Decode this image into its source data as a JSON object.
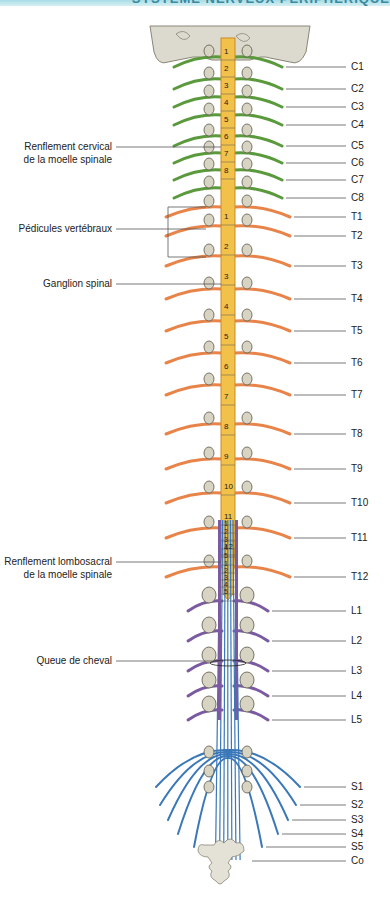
{
  "header": {
    "title": "SYSTÈME NERVEUX PÉRIPHÉRIQUE"
  },
  "colors": {
    "cervical": "#5a9a3c",
    "thoracic": "#e8844a",
    "lumbar": "#7a5aa0",
    "sacral": "#3a78b8",
    "cord": "#f2c14a",
    "bone": "#d8d4c4",
    "leader": "#555555"
  },
  "left_labels": [
    {
      "id": "cervical-enlargement",
      "line1": "Renflement cervical",
      "line2": "de la moelle spinale",
      "y": 147
    },
    {
      "id": "vertebral-pedicles",
      "line1": "Pédicules vertébraux",
      "line2": "",
      "y": 229
    },
    {
      "id": "spinal-ganglion",
      "line1": "Ganglion spinal",
      "line2": "",
      "y": 284
    },
    {
      "id": "lumbosacral-enlargement",
      "line1": "Renflement lombosacral",
      "line2": "de la moelle spinale",
      "y": 562
    },
    {
      "id": "cauda-equina",
      "line1": "Queue de cheval",
      "line2": "",
      "y": 661
    }
  ],
  "right_labels": [
    {
      "label": "C1",
      "y": 67
    },
    {
      "label": "C2",
      "y": 89
    },
    {
      "label": "C3",
      "y": 107
    },
    {
      "label": "C4",
      "y": 125
    },
    {
      "label": "C5",
      "y": 146
    },
    {
      "label": "C6",
      "y": 163
    },
    {
      "label": "C7",
      "y": 180
    },
    {
      "label": "C8",
      "y": 198
    },
    {
      "label": "T1",
      "y": 217
    },
    {
      "label": "T2",
      "y": 236
    },
    {
      "label": "T3",
      "y": 266
    },
    {
      "label": "T4",
      "y": 299
    },
    {
      "label": "T5",
      "y": 331
    },
    {
      "label": "T6",
      "y": 363
    },
    {
      "label": "T7",
      "y": 395
    },
    {
      "label": "T8",
      "y": 434
    },
    {
      "label": "T9",
      "y": 469
    },
    {
      "label": "T10",
      "y": 503
    },
    {
      "label": "T11",
      "y": 538
    },
    {
      "label": "T12",
      "y": 577
    },
    {
      "label": "L1",
      "y": 611
    },
    {
      "label": "L2",
      "y": 641
    },
    {
      "label": "L3",
      "y": 671
    },
    {
      "label": "L4",
      "y": 696
    },
    {
      "label": "L5",
      "y": 720
    },
    {
      "label": "S1",
      "y": 787
    },
    {
      "label": "S2",
      "y": 805
    },
    {
      "label": "S3",
      "y": 820
    },
    {
      "label": "S4",
      "y": 834
    },
    {
      "label": "S5",
      "y": 847
    },
    {
      "label": "Co",
      "y": 861
    }
  ],
  "cord_segments": {
    "cervical": [
      "1",
      "2",
      "3",
      "4",
      "5",
      "6",
      "7",
      "8"
    ],
    "thoracic": [
      "1",
      "2",
      "3",
      "4",
      "5",
      "6",
      "7",
      "8",
      "9",
      "10",
      "11",
      "12"
    ],
    "lumbar": [
      "1",
      "2",
      "3",
      "4",
      "5"
    ],
    "sacral": [
      "1",
      "2",
      "3",
      "4",
      "5"
    ]
  }
}
